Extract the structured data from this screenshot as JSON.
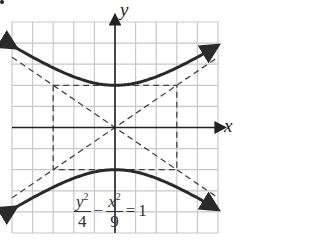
{
  "figure": {
    "x_axis_label": "x",
    "y_axis_label": "y",
    "equation": {
      "term1_numerator": "y",
      "term1_numerator_exp": "2",
      "term1_denominator": "4",
      "operator": "−",
      "term2_numerator": "x",
      "term2_numerator_exp": "2",
      "term2_denominator": "9",
      "equals": "=",
      "rhs": "1"
    }
  },
  "chart_data": {
    "type": "line",
    "title": "",
    "xlabel": "x",
    "ylabel": "y",
    "xlim": [
      -5,
      5
    ],
    "ylim": [
      -5,
      5
    ],
    "grid": true,
    "grid_step": 1,
    "series": [
      {
        "name": "upper branch",
        "equation": "y = 2*sqrt(1 + x^2/9)",
        "style": "solid",
        "vertex": [
          0,
          2
        ]
      },
      {
        "name": "lower branch",
        "equation": "y = -2*sqrt(1 + x^2/9)",
        "style": "solid",
        "vertex": [
          0,
          -2
        ]
      },
      {
        "name": "asymptote 1",
        "equation": "y = (2/3)x",
        "style": "dashed"
      },
      {
        "name": "asymptote 2",
        "equation": "y = -(2/3)x",
        "style": "dashed"
      },
      {
        "name": "central rectangle",
        "corners": [
          [
            -3,
            2
          ],
          [
            3,
            2
          ],
          [
            3,
            -2
          ],
          [
            -3,
            -2
          ]
        ],
        "style": "dashed"
      }
    ],
    "annotations": [
      "y^2/4 - x^2/9 = 1"
    ]
  },
  "colors": {
    "grid": "#c8c8c8",
    "axes": "#222222",
    "curve": "#2a2a2a",
    "dashed": "#444444"
  }
}
